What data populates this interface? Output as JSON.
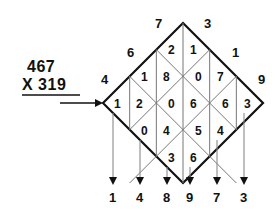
{
  "problem": {
    "multiplicand": "467",
    "multiplier_line": "X 319",
    "multiplier_symbol": "X",
    "multiplier": "319"
  },
  "lattice": {
    "top_labels": [
      "7",
      "3"
    ],
    "left_labels": [
      "4",
      "6"
    ],
    "right_labels": [
      "1",
      "9"
    ],
    "corner_top_left_label": "4",
    "rows": [
      {
        "cells": [
          {
            "tens": "2",
            "ones": "1"
          }
        ]
      },
      {
        "cells": [
          {
            "tens": "1",
            "ones": "8"
          },
          {
            "tens": "0",
            "ones": "7"
          }
        ]
      },
      {
        "cells": [
          {
            "tens": "1",
            "ones": "2"
          },
          {
            "tens": "0",
            "ones": "6"
          },
          {
            "tens": "6",
            "ones": "3"
          }
        ]
      },
      {
        "cells": [
          {
            "tens": "0",
            "ones": "4"
          },
          {
            "tens": "5",
            "ones": "4"
          }
        ]
      },
      {
        "cells": [
          {
            "tens": "3",
            "ones": "6"
          }
        ]
      }
    ]
  },
  "answer": {
    "digits": [
      "1",
      "4",
      "8",
      "9",
      "7",
      "3"
    ]
  },
  "colors": {
    "ink": "#111111",
    "grid_light": "#777777",
    "background": "#ffffff"
  },
  "icons": {
    "flow_arrow": "right-arrow-icon",
    "result_arrow": "down-arrow-icon"
  }
}
